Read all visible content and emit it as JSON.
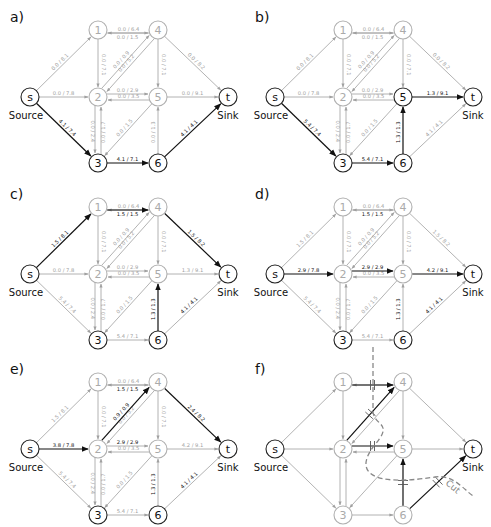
{
  "figure": {
    "width": 491,
    "height": 527,
    "colors": {
      "active": "#111111",
      "inactive": "#a0a0a0",
      "node_active": "#222222",
      "node_inactive": "#b0b0b0",
      "cut": "#888888"
    }
  },
  "layout": {
    "nodes": {
      "s": [
        30,
        97
      ],
      "1": [
        98,
        30
      ],
      "4": [
        158,
        30
      ],
      "2": [
        98,
        97
      ],
      "5": [
        158,
        97
      ],
      "t": [
        228,
        97
      ],
      "3": [
        98,
        163
      ],
      "6": [
        158,
        163
      ]
    },
    "node_radius": 9,
    "panel_offsets": [
      [
        0,
        0
      ],
      [
        245,
        0
      ],
      [
        0,
        177
      ],
      [
        245,
        177
      ],
      [
        0,
        352
      ],
      [
        245,
        352
      ]
    ]
  },
  "labels": {
    "source": "Source",
    "sink": "Sink",
    "cut": "Cut"
  },
  "panels": [
    {
      "id": "a",
      "label": "a)",
      "active_nodes": [
        "s",
        "3",
        "6",
        "t"
      ],
      "edges": [
        {
          "from": "s",
          "to": "1",
          "label": "0.0 / 8.1",
          "active": false
        },
        {
          "from": "s",
          "to": "2",
          "label": "0.0 / 7.8",
          "active": false
        },
        {
          "from": "s",
          "to": "3",
          "label": "4.1 / 7.4",
          "active": true
        },
        {
          "from": "4",
          "to": "1",
          "label": "0.0 / 6.4",
          "active": false,
          "offset": -3
        },
        {
          "from": "1",
          "to": "4",
          "label": "0.0 / 1.5",
          "active": false,
          "offset": 3
        },
        {
          "from": "1",
          "to": "2",
          "label": "0.0 / 7.1",
          "active": false
        },
        {
          "from": "4",
          "to": "2",
          "label": "0.0 / 5.2",
          "active": false,
          "offset": -3
        },
        {
          "from": "2",
          "to": "4",
          "label": "0.0 / 0.9",
          "active": false,
          "offset": -3
        },
        {
          "from": "4",
          "to": "5",
          "label": "0.0 / 7.1",
          "active": false
        },
        {
          "from": "4",
          "to": "t",
          "label": "0.0 / 8.2",
          "active": false
        },
        {
          "from": "5",
          "to": "2",
          "label": "0.0 / 3.5",
          "active": false,
          "offset": -3
        },
        {
          "from": "2",
          "to": "5",
          "label": "0.0 / 2.9",
          "active": false,
          "offset": -3
        },
        {
          "from": "5",
          "to": "t",
          "label": "0.0 / 9.1",
          "active": false
        },
        {
          "from": "3",
          "to": "2",
          "label": "0.0 / 1.7",
          "active": false,
          "offset": 3
        },
        {
          "from": "2",
          "to": "3",
          "label": "0.0 / 2.4",
          "active": false,
          "offset": 3
        },
        {
          "from": "5",
          "to": "3",
          "label": "0.0 / 1.5",
          "active": false
        },
        {
          "from": "3",
          "to": "6",
          "label": "4.1 / 7.1",
          "active": true
        },
        {
          "from": "6",
          "to": "5",
          "label": "0.0 / 1.3",
          "active": false
        },
        {
          "from": "6",
          "to": "t",
          "label": "4.1 / 4.1",
          "active": true
        }
      ]
    },
    {
      "id": "b",
      "label": "b)",
      "active_nodes": [
        "s",
        "3",
        "6",
        "5",
        "t"
      ],
      "edges": [
        {
          "from": "s",
          "to": "1",
          "label": "0.0 / 8.1",
          "active": false
        },
        {
          "from": "s",
          "to": "2",
          "label": "0.0 / 7.8",
          "active": false
        },
        {
          "from": "s",
          "to": "3",
          "label": "5.4 / 7.4",
          "active": true
        },
        {
          "from": "4",
          "to": "1",
          "label": "0.0 / 6.4",
          "active": false,
          "offset": -3
        },
        {
          "from": "1",
          "to": "4",
          "label": "0.0 / 1.5",
          "active": false,
          "offset": 3
        },
        {
          "from": "1",
          "to": "2",
          "label": "0.0 / 7.1",
          "active": false
        },
        {
          "from": "4",
          "to": "2",
          "label": "0.0 / 5.2",
          "active": false,
          "offset": -3
        },
        {
          "from": "2",
          "to": "4",
          "label": "0.0 / 0.9",
          "active": false,
          "offset": -3
        },
        {
          "from": "4",
          "to": "5",
          "label": "0.0 / 7.1",
          "active": false
        },
        {
          "from": "4",
          "to": "t",
          "label": "0.0 / 8.2",
          "active": false
        },
        {
          "from": "5",
          "to": "2",
          "label": "0.0 / 3.5",
          "active": false,
          "offset": -3
        },
        {
          "from": "2",
          "to": "5",
          "label": "0.0 / 2.9",
          "active": false,
          "offset": -3
        },
        {
          "from": "5",
          "to": "t",
          "label": "1.3 / 9.1",
          "active": true
        },
        {
          "from": "3",
          "to": "2",
          "label": "0.0 / 1.7",
          "active": false,
          "offset": 3
        },
        {
          "from": "2",
          "to": "3",
          "label": "0.0 / 2.4",
          "active": false,
          "offset": 3
        },
        {
          "from": "5",
          "to": "3",
          "label": "0.0 / 1.5",
          "active": false
        },
        {
          "from": "3",
          "to": "6",
          "label": "5.4 / 7.1",
          "active": true
        },
        {
          "from": "6",
          "to": "5",
          "label": "1.3 / 1.3",
          "active": true
        },
        {
          "from": "6",
          "to": "t",
          "label": "4.1 / 4.1",
          "active": false
        }
      ]
    },
    {
      "id": "c",
      "label": "c)",
      "active_nodes": [
        "s",
        "3",
        "6",
        "t"
      ],
      "edges": [
        {
          "from": "s",
          "to": "1",
          "label": "1.5 / 8.1",
          "active": true
        },
        {
          "from": "s",
          "to": "2",
          "label": "0.0 / 7.8",
          "active": false
        },
        {
          "from": "s",
          "to": "3",
          "label": "5.4 / 7.4",
          "active": false
        },
        {
          "from": "4",
          "to": "1",
          "label": "0.0 / 6.4",
          "active": false,
          "offset": -3
        },
        {
          "from": "1",
          "to": "4",
          "label": "1.5 / 1.5",
          "active": true,
          "offset": 3
        },
        {
          "from": "1",
          "to": "2",
          "label": "0.0 / 7.1",
          "active": false
        },
        {
          "from": "4",
          "to": "2",
          "label": "0.0 / 5.2",
          "active": false,
          "offset": -3
        },
        {
          "from": "2",
          "to": "4",
          "label": "0.0 / 0.9",
          "active": false,
          "offset": -3
        },
        {
          "from": "4",
          "to": "5",
          "label": "0.0 / 7.1",
          "active": false
        },
        {
          "from": "4",
          "to": "t",
          "label": "1.5 / 8.2",
          "active": true
        },
        {
          "from": "5",
          "to": "2",
          "label": "0.0 / 3.5",
          "active": false,
          "offset": -3
        },
        {
          "from": "2",
          "to": "5",
          "label": "0.0 / 2.9",
          "active": false,
          "offset": -3
        },
        {
          "from": "5",
          "to": "t",
          "label": "1.3 / 9.1",
          "active": false
        },
        {
          "from": "3",
          "to": "2",
          "label": "0.0 / 1.7",
          "active": false,
          "offset": 3
        },
        {
          "from": "2",
          "to": "3",
          "label": "0.0 / 2.4",
          "active": false,
          "offset": 3
        },
        {
          "from": "5",
          "to": "3",
          "label": "0.0 / 1.5",
          "active": false
        },
        {
          "from": "3",
          "to": "6",
          "label": "5.4 / 7.1",
          "active": false
        },
        {
          "from": "6",
          "to": "5",
          "label": "1.3 / 1.3",
          "active": true,
          "dark_label": true
        },
        {
          "from": "6",
          "to": "t",
          "label": "4.1 / 4.1",
          "active": false,
          "dark_label": true
        }
      ]
    },
    {
      "id": "d",
      "label": "d)",
      "active_nodes": [
        "s",
        "3",
        "6",
        "t"
      ],
      "edges": [
        {
          "from": "s",
          "to": "1",
          "label": "1.5 / 8.1",
          "active": false
        },
        {
          "from": "s",
          "to": "2",
          "label": "2.9 / 7.8",
          "active": true
        },
        {
          "from": "s",
          "to": "3",
          "label": "5.4 / 7.4",
          "active": false
        },
        {
          "from": "4",
          "to": "1",
          "label": "0.0 / 6.4",
          "active": false,
          "offset": -3
        },
        {
          "from": "1",
          "to": "4",
          "label": "1.5 / 1.5",
          "active": false,
          "offset": 3,
          "dark_label": true
        },
        {
          "from": "1",
          "to": "2",
          "label": "0.0 / 7.1",
          "active": false
        },
        {
          "from": "4",
          "to": "2",
          "label": "0.0 / 5.2",
          "active": false,
          "offset": -3
        },
        {
          "from": "2",
          "to": "4",
          "label": "0.0 / 0.9",
          "active": false,
          "offset": -3
        },
        {
          "from": "4",
          "to": "5",
          "label": "0.0 / 7.1",
          "active": false
        },
        {
          "from": "4",
          "to": "t",
          "label": "1.5 / 8.2",
          "active": false
        },
        {
          "from": "5",
          "to": "2",
          "label": "0.0 / 3.5",
          "active": false,
          "offset": -3
        },
        {
          "from": "2",
          "to": "5",
          "label": "2.9 / 2.9",
          "active": true,
          "offset": -3
        },
        {
          "from": "5",
          "to": "t",
          "label": "4.2 / 9.1",
          "active": true
        },
        {
          "from": "3",
          "to": "2",
          "label": "0.0 / 1.7",
          "active": false,
          "offset": 3
        },
        {
          "from": "2",
          "to": "3",
          "label": "0.0 / 2.4",
          "active": false,
          "offset": 3
        },
        {
          "from": "5",
          "to": "3",
          "label": "0.0 / 1.5",
          "active": false
        },
        {
          "from": "3",
          "to": "6",
          "label": "5.4 / 7.1",
          "active": false
        },
        {
          "from": "6",
          "to": "5",
          "label": "1.3 / 1.3",
          "active": false,
          "dark_label": true
        },
        {
          "from": "6",
          "to": "t",
          "label": "4.1 / 4.1",
          "active": false,
          "dark_label": true
        }
      ]
    },
    {
      "id": "e",
      "label": "e)",
      "active_nodes": [
        "s",
        "3",
        "6",
        "t"
      ],
      "edges": [
        {
          "from": "s",
          "to": "1",
          "label": "1.5 / 8.1",
          "active": false
        },
        {
          "from": "s",
          "to": "2",
          "label": "3.8 / 7.8",
          "active": true
        },
        {
          "from": "s",
          "to": "3",
          "label": "5.4 / 7.4",
          "active": false
        },
        {
          "from": "4",
          "to": "1",
          "label": "0.0 / 6.4",
          "active": false,
          "offset": -3
        },
        {
          "from": "1",
          "to": "4",
          "label": "1.5 / 1.5",
          "active": false,
          "offset": 3,
          "dark_label": true
        },
        {
          "from": "1",
          "to": "2",
          "label": "0.0 / 7.1",
          "active": false
        },
        {
          "from": "4",
          "to": "2",
          "label": "0.0 / 5.2",
          "active": false,
          "offset": -3
        },
        {
          "from": "2",
          "to": "4",
          "label": "0.9 / 0.9",
          "active": true,
          "offset": -3
        },
        {
          "from": "4",
          "to": "5",
          "label": "0.0 / 7.1",
          "active": false
        },
        {
          "from": "4",
          "to": "t",
          "label": "2.4 / 8.2",
          "active": true
        },
        {
          "from": "5",
          "to": "2",
          "label": "0.0 / 3.5",
          "active": false,
          "offset": -3
        },
        {
          "from": "2",
          "to": "5",
          "label": "2.9 / 2.9",
          "active": false,
          "offset": -3,
          "dark_label": true
        },
        {
          "from": "5",
          "to": "t",
          "label": "4.2 / 9.1",
          "active": false
        },
        {
          "from": "3",
          "to": "2",
          "label": "0.0 / 1.7",
          "active": false,
          "offset": 3
        },
        {
          "from": "2",
          "to": "3",
          "label": "0.0 / 2.4",
          "active": false,
          "offset": 3
        },
        {
          "from": "5",
          "to": "3",
          "label": "0.0 / 1.5",
          "active": false
        },
        {
          "from": "3",
          "to": "6",
          "label": "5.4 / 7.1",
          "active": false
        },
        {
          "from": "6",
          "to": "5",
          "label": "1.3 / 1.3",
          "active": false,
          "dark_label": true
        },
        {
          "from": "6",
          "to": "t",
          "label": "4.1 / 4.1",
          "active": false,
          "dark_label": true
        }
      ]
    },
    {
      "id": "f",
      "label": "f)",
      "active_nodes": [
        "s",
        "t"
      ],
      "edges": [
        {
          "from": "s",
          "to": "1",
          "active": false
        },
        {
          "from": "s",
          "to": "2",
          "active": false
        },
        {
          "from": "s",
          "to": "3",
          "active": false
        },
        {
          "from": "4",
          "to": "1",
          "active": false,
          "offset": -3
        },
        {
          "from": "1",
          "to": "4",
          "active": true,
          "offset": 3,
          "cut_mark": true
        },
        {
          "from": "1",
          "to": "2",
          "active": false
        },
        {
          "from": "4",
          "to": "2",
          "active": false,
          "offset": -3
        },
        {
          "from": "2",
          "to": "4",
          "active": true,
          "offset": -3,
          "cut_mark": true
        },
        {
          "from": "4",
          "to": "5",
          "active": false
        },
        {
          "from": "4",
          "to": "t",
          "active": false
        },
        {
          "from": "5",
          "to": "2",
          "active": false,
          "offset": -3
        },
        {
          "from": "2",
          "to": "5",
          "active": true,
          "offset": -3,
          "cut_mark": true
        },
        {
          "from": "5",
          "to": "t",
          "active": false
        },
        {
          "from": "3",
          "to": "2",
          "active": false,
          "offset": 3
        },
        {
          "from": "2",
          "to": "3",
          "active": false,
          "offset": 3
        },
        {
          "from": "5",
          "to": "3",
          "active": false
        },
        {
          "from": "3",
          "to": "6",
          "active": false
        },
        {
          "from": "6",
          "to": "5",
          "active": true,
          "cut_mark": true
        },
        {
          "from": "6",
          "to": "t",
          "active": true,
          "cut_mark": true
        }
      ],
      "cut_path": "M 128 -5 L 128 60 C 130 75 150 70 128 95 C 110 120 125 135 190 125 C 210 122 220 140 230 145"
    }
  ]
}
